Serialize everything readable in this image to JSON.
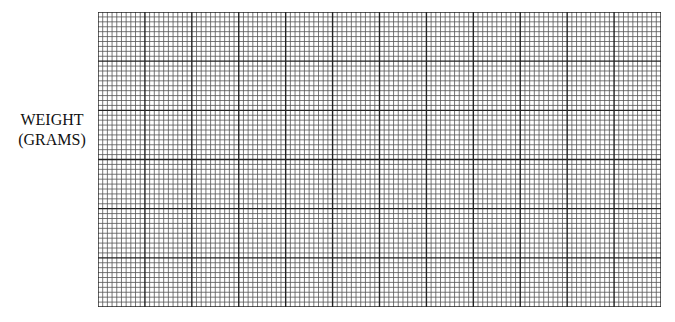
{
  "chart_data": {
    "type": "line",
    "title": "",
    "xlabel": "",
    "ylabel": "WEIGHT (GRAMS)",
    "ylabel_lines": [
      "WEIGHT",
      "(GRAMS)"
    ],
    "series": [],
    "grid": {
      "on": true,
      "major_columns": 12,
      "major_rows": 6,
      "minor_per_major": 10,
      "line_color": "#222222"
    },
    "legend": null
  }
}
